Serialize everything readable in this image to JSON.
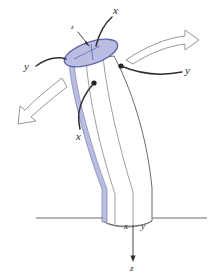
{
  "figure": {
    "background_color": "#ffffff",
    "tube_fill": "#ffffff",
    "tube_stroke": "#5a5a5a",
    "highlight_stripe_color": "#b9bde0",
    "highlight_stripe_stroke": "#7b7fb5",
    "section_ellipse_fill": "#b9bee2",
    "section_ellipse_stroke": "#5f64a8",
    "leader_line_color": "#2f2f33",
    "arrow_outline_color": "#8a8a8a",
    "ground_line_color": "#6e6e6e"
  },
  "labels": {
    "top_x": "x",
    "top_z": "z",
    "left_y": "y",
    "right_y": "y",
    "lower_x": "x",
    "base_x": "x",
    "base_y": "y",
    "base_z": "z"
  },
  "annotations": {
    "leader_dots": 2,
    "deflection_arrows": [
      {
        "name": "upper-right-deflection-arrow",
        "direction": "right"
      },
      {
        "name": "lower-left-deflection-arrow",
        "direction": "lower-left"
      }
    ]
  }
}
